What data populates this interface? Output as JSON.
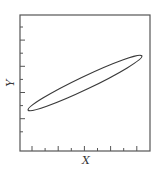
{
  "chart_data": {
    "type": "scatter",
    "title": "",
    "xlabel": "X",
    "ylabel": "Y",
    "grid": false,
    "legend": null,
    "xlim": [
      0,
      1
    ],
    "ylim": [
      0,
      1
    ],
    "x_ticks_count": 9,
    "y_ticks_count": 9,
    "tick_labels": false,
    "shapes": [
      {
        "kind": "ellipse",
        "description": "Elongated ellipse indicating positive correlation between X and Y",
        "center": [
          0.5,
          0.5
        ],
        "left_tip": [
          0.06,
          0.29
        ],
        "right_tip": [
          0.94,
          0.7
        ],
        "angle_deg": 25.5,
        "minor_to_major_ratio": 0.1,
        "stroke_color": "#3a3a3a"
      }
    ]
  },
  "labels": {
    "x": "X",
    "y": "Y"
  },
  "colors": {
    "frame": "#555555",
    "curve": "#3a3a3a",
    "background": "#ffffff"
  }
}
